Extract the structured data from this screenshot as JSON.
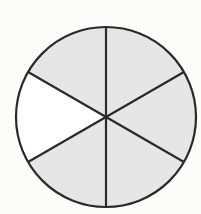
{
  "diagram": {
    "shape": "circle",
    "center": [
      106,
      117
    ],
    "radius": 90,
    "total_parts": 6,
    "shaded_parts": 5,
    "unshaded_part_index": 3,
    "divider_angles_deg": [
      90,
      30,
      -30,
      -90,
      -150,
      150
    ],
    "colors": {
      "background": "#fcfcfb",
      "shaded": "#e6e6e6",
      "unshaded": "#ffffff",
      "stroke": "#2a2a2a"
    },
    "stroke_width": 2.2
  }
}
